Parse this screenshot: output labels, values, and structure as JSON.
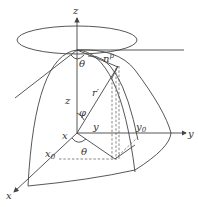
{
  "figure": {
    "labels": {
      "z_axis": "z",
      "y_axis": "y",
      "x_axis": "x",
      "theta_top": "θ",
      "n_p": "n",
      "n_p_sup": "p",
      "r_prime": "r′",
      "z_height": "z",
      "phi": "φ",
      "y_len": "y",
      "y0": "y",
      "y0_sub": "0",
      "x_len": "x",
      "x0": "x",
      "x0_sub": "0",
      "theta_bottom": "θ"
    },
    "colors": {
      "stroke": "#444444",
      "text": "#333333",
      "background": "#ffffff"
    }
  }
}
